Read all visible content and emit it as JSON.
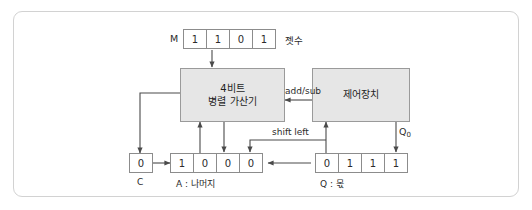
{
  "figure": {
    "border_color": "#d2d2d2",
    "box_fill": "#e6e6e6",
    "line_color": "#5a5a5a"
  },
  "registers": {
    "m": {
      "name": "M",
      "bits": [
        "1",
        "1",
        "0",
        "1"
      ],
      "annotation": "젯수"
    },
    "c": {
      "name": "C",
      "bits": [
        "0"
      ],
      "annotation": "C"
    },
    "a": {
      "name": "A",
      "bits": [
        "1",
        "0",
        "0",
        "0"
      ],
      "annotation": "A : 나머지"
    },
    "q": {
      "name": "Q",
      "bits": [
        "0",
        "1",
        "1",
        "1"
      ],
      "annotation": "Q : 몫"
    }
  },
  "blocks": {
    "adder": {
      "line1": "4비트",
      "line2": "병렬 가산기"
    },
    "control": {
      "line1": "제어장치"
    }
  },
  "signals": {
    "add_sub": "add/sub",
    "shift_left": "shift left",
    "q0": "Q",
    "q0_sub": "0"
  }
}
